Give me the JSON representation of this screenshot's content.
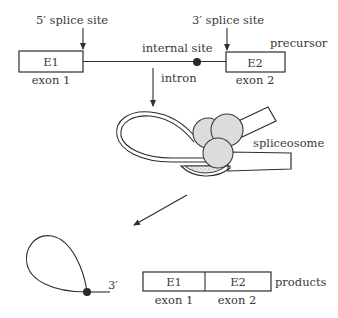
{
  "precursor": {
    "label": "precursor",
    "five_prime_site": "5′ splice site",
    "three_prime_site": "3′ splice site",
    "internal_site": "internal site",
    "intron_label": "intron",
    "exon1": {
      "box": "E1",
      "name": "exon 1"
    },
    "exon2": {
      "box": "E2",
      "name": "exon 2"
    }
  },
  "spliceosome": {
    "label": "spliceosome"
  },
  "lariat": {
    "end_label": "3′"
  },
  "products": {
    "label": "products",
    "exon1": {
      "box": "E1",
      "name": "exon 1"
    },
    "exon2": {
      "box": "E2",
      "name": "exon 2"
    }
  },
  "colors": {
    "line": "#2e2e2e",
    "text": "#3a3a3a",
    "stipple": "#dcdcdc"
  }
}
